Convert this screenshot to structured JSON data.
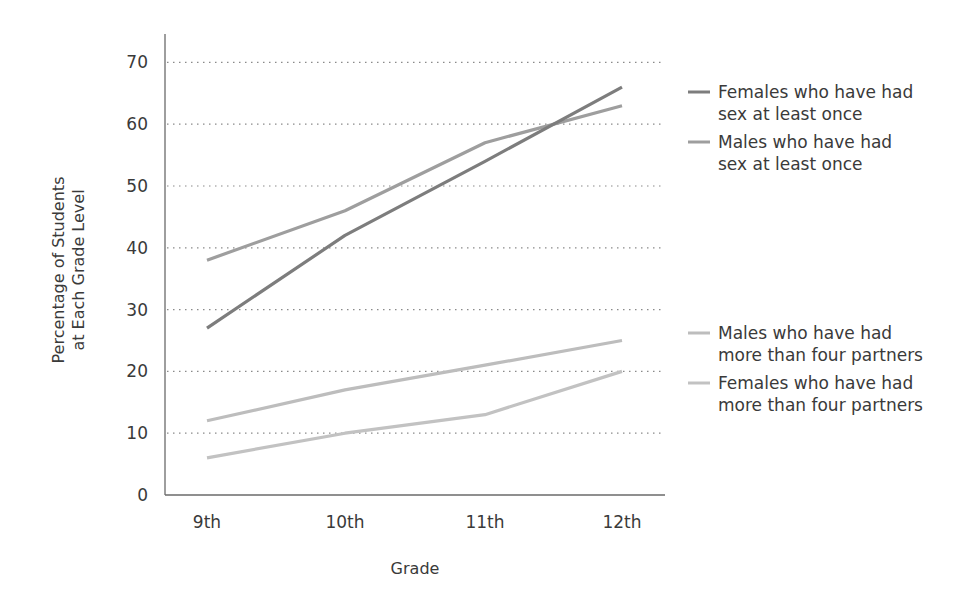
{
  "chart_data": {
    "type": "line",
    "title": "",
    "xlabel": "Grade",
    "ylabel": [
      "Percentage of Students",
      "at Each Grade Level"
    ],
    "categories": [
      "9th",
      "10th",
      "11th",
      "12th"
    ],
    "yticks": [
      0,
      10,
      20,
      30,
      40,
      50,
      60,
      70
    ],
    "ylim": [
      0,
      70
    ],
    "grid": "horizontal dotted",
    "legend_position": "right",
    "series": [
      {
        "name": "Females who have had sex at least once",
        "legend_lines": [
          "Females who have had",
          "sex at least once"
        ],
        "color": "#7d7d7d",
        "values": [
          27,
          42,
          54,
          66
        ]
      },
      {
        "name": "Males who have had sex at least once",
        "legend_lines": [
          "Males who have had",
          "sex at least once"
        ],
        "color": "#9e9e9e",
        "values": [
          38,
          46,
          57,
          63
        ]
      },
      {
        "name": "Males who have had more than four partners",
        "legend_lines": [
          "Males who have had",
          "more than four partners"
        ],
        "color": "#bdbdbd",
        "values": [
          12,
          17,
          21,
          25
        ]
      },
      {
        "name": "Females who have had more than four partners",
        "legend_lines": [
          "Females who have had",
          "more than four partners"
        ],
        "color": "#c2c2c2",
        "values": [
          6,
          10,
          13,
          20
        ]
      }
    ]
  }
}
